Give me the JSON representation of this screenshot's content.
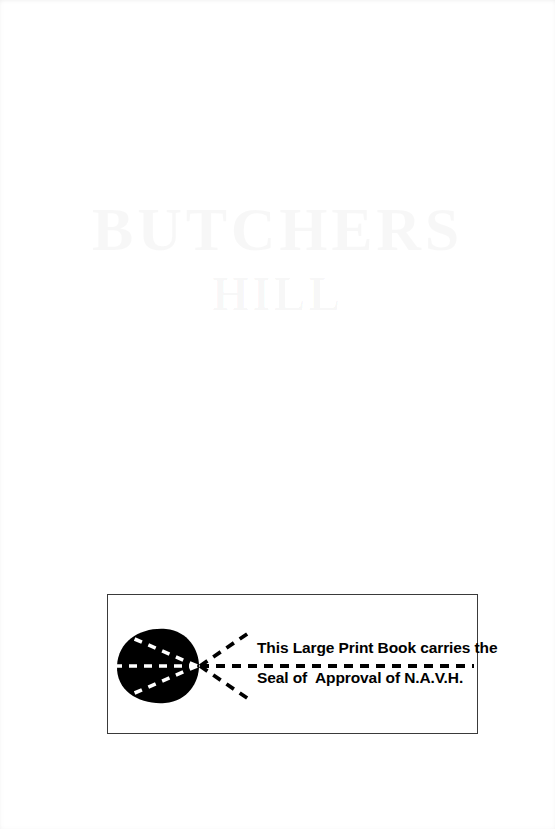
{
  "page": {
    "background_color": "#ffffff",
    "width": 555,
    "height": 829
  },
  "ghost_text": {
    "description": "faint show-through lettering from reverse side of page",
    "line1": "BUTCHERS",
    "line2": "HILL"
  },
  "seal": {
    "box": {
      "border_color": "#3a3a3a",
      "background_color": "#ffffff"
    },
    "emblem": {
      "name": "navh-eye-emblem",
      "blob_color": "#000000",
      "ray_color": "#000000",
      "inner_ray_color": "#ffffff"
    },
    "text": {
      "line1": "This Large Print Book carries the",
      "line2": "Seal of  Approval of N.A.V.H.",
      "color": "#000000"
    }
  }
}
